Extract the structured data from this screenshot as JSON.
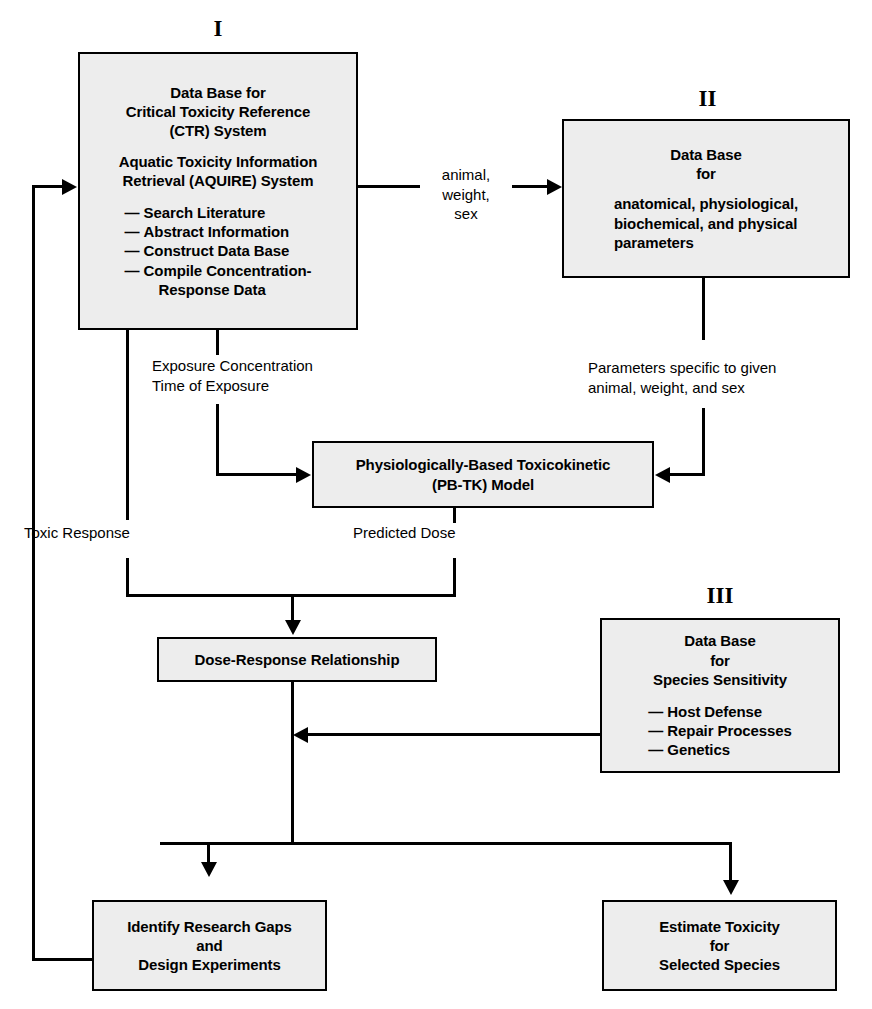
{
  "diagram": {
    "colors": {
      "box_fill": "#ededed",
      "stroke": "#000000",
      "background": "#ffffff"
    }
  },
  "numerals": {
    "one": "I",
    "two": "II",
    "three": "III"
  },
  "boxes": {
    "database_ctr": {
      "lines": [
        "Data Base for",
        "Critical Toxicity Reference",
        "(CTR) System"
      ],
      "lines2": [
        "Aquatic Toxicity Information",
        "Retrieval (AQUIRE) System"
      ],
      "bullets": [
        "Search Literature",
        "Abstract Information",
        "Construct Data Base",
        "Compile Concentration-"
      ],
      "bullet_cont": "Response Data"
    },
    "database_params": {
      "lines": [
        "Data Base",
        "for"
      ],
      "lines2": [
        "anatomical, physiological,",
        "biochemical, and physical",
        "parameters"
      ]
    },
    "pbtk_model": {
      "lines": [
        "Physiologically-Based Toxicokinetic",
        "(PB-TK) Model"
      ]
    },
    "dose_response": {
      "lines": [
        "Dose-Response Relationship"
      ]
    },
    "database_species": {
      "lines": [
        "Data Base",
        "for",
        "Species Sensitivity"
      ],
      "bullets": [
        "Host Defense",
        "Repair Processes",
        "Genetics"
      ]
    },
    "identify_gaps": {
      "lines": [
        "Identify Research Gaps",
        "and",
        "Design Experiments"
      ]
    },
    "estimate_toxicity": {
      "lines": [
        "Estimate Toxicity",
        "for",
        "Selected Species"
      ]
    }
  },
  "edge_labels": {
    "animal_weight_sex": [
      "animal,",
      "weight,",
      "sex"
    ],
    "exposure": [
      "Exposure Concentration",
      "Time of Exposure"
    ],
    "parameters_specific": [
      "Parameters specific to given",
      "animal, weight, and sex"
    ],
    "toxic_response": "Toxic Response",
    "predicted_dose": "Predicted Dose"
  },
  "bullet_marker": "—"
}
